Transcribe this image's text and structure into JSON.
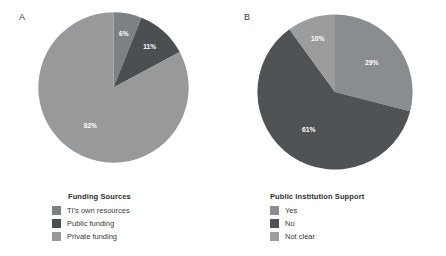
{
  "figure": {
    "background": "#ffffff"
  },
  "panels": [
    {
      "letter": "A",
      "legend_title": "Funding Sources",
      "labels": [
        "TI's own resources",
        "Public funding",
        "Private funding"
      ],
      "values": [
        6,
        11,
        82
      ],
      "value_labels": [
        "6%",
        "11%",
        "82%"
      ],
      "colors": [
        "#7d8183",
        "#4a4f52",
        "#97999b"
      ]
    },
    {
      "letter": "B",
      "legend_title": "Public Institution Support",
      "labels": [
        "Yes",
        "No",
        "Not clear"
      ],
      "values": [
        29,
        61,
        10
      ],
      "value_labels": [
        "29%",
        "61%",
        "10%"
      ],
      "colors": [
        "#8a8d8f",
        "#4f5356",
        "#9a9c9e"
      ]
    }
  ],
  "chart_data": [
    {
      "type": "pie",
      "title": "Funding Sources",
      "panel": "A",
      "categories": [
        "TI's own resources",
        "Public funding",
        "Private funding"
      ],
      "values": [
        6,
        11,
        82
      ],
      "unit": "percent",
      "data_labels": [
        "6%",
        "11%",
        "82%"
      ],
      "colors": [
        "#7d8183",
        "#4a4f52",
        "#97999b"
      ],
      "legend_position": "bottom",
      "start_angle_deg": 0,
      "direction": "clockwise",
      "total": 99
    },
    {
      "type": "pie",
      "title": "Public Institution Support",
      "panel": "B",
      "categories": [
        "Yes",
        "No",
        "Not clear"
      ],
      "values": [
        29,
        61,
        10
      ],
      "unit": "percent",
      "data_labels": [
        "29%",
        "61%",
        "10%"
      ],
      "colors": [
        "#8a8d8f",
        "#4f5356",
        "#9a9c9e"
      ],
      "legend_position": "bottom",
      "start_angle_deg": 0,
      "direction": "clockwise",
      "total": 100
    }
  ]
}
